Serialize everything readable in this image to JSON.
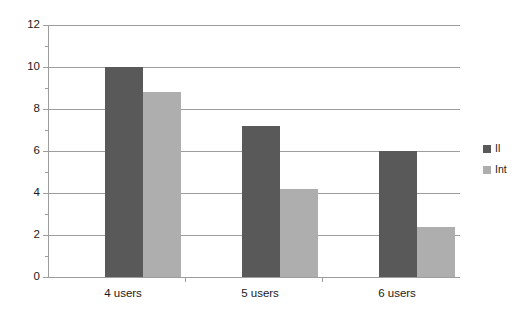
{
  "chart_data": {
    "type": "bar",
    "title": "",
    "subtitle": "",
    "xlabel": "",
    "ylabel": "",
    "categories": [
      "4 users",
      "5 users",
      "6 users"
    ],
    "series": [
      {
        "name": "Il",
        "color": "#595959",
        "values": [
          10.0,
          7.2,
          6.0
        ]
      },
      {
        "name": "Int",
        "color": "#aeaeae",
        "values": [
          8.8,
          4.2,
          2.4
        ]
      }
    ],
    "ylim": [
      0,
      12
    ],
    "yticks": [
      0,
      2,
      4,
      6,
      8,
      10,
      12
    ],
    "ytick_labels": [
      "0",
      "2",
      "4",
      "6",
      "8",
      "10",
      "12"
    ],
    "grid": true,
    "grid_axis": "y",
    "legend_position": "right",
    "background_color": "#ffffff",
    "axis_color": "#9d9d9d",
    "text_color": "#1a1a1a"
  },
  "legend": {
    "entries": [
      {
        "label": "Il"
      },
      {
        "label": "Int"
      }
    ]
  },
  "axes": {
    "y": {
      "labels": [
        "12",
        "10",
        "8",
        "6",
        "4",
        "2",
        "0"
      ]
    },
    "x": {
      "labels": [
        "4 users",
        "5 users",
        "6 users"
      ]
    }
  }
}
